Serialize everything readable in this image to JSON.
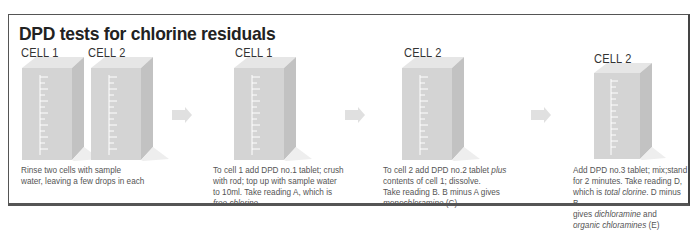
{
  "title": "DPD tests for chlorine residuals",
  "steps": [
    {
      "cells": [
        "CELL 1",
        "CELL 2"
      ],
      "caption_lines": [
        "Rinse two cells with sample",
        "water, leaving a few drops in each"
      ]
    },
    {
      "cells": [
        "CELL 1"
      ],
      "caption_lines": [
        "To cell 1 add DPD no.1 tablet; crush",
        "with rod; top up with sample water",
        "to 10ml. Take reading A, which is"
      ],
      "caption_italic": "free chlorine"
    },
    {
      "cells": [
        "CELL 2"
      ],
      "caption_line1_pre": "To cell 2 add DPD no.2 tablet ",
      "caption_line1_italic": "plus",
      "caption_lines": [
        "contents of cell 1; dissolve.",
        "Take reading B. B minus A gives"
      ],
      "caption_italic": "monochloramine",
      "caption_suffix": " (C)"
    },
    {
      "cells": [
        "CELL 2"
      ],
      "caption_lines": [
        "Add DPD no.3 tablet; mix;stand",
        "for 2 minutes. Take reading D,"
      ],
      "caption_l3_pre": "which is ",
      "caption_l3_italic": "total clorine",
      "caption_l3_post": ". D minus B",
      "caption_l4_pre": "gives ",
      "caption_l4_italic": "dichloramine",
      "caption_l4_post": " and",
      "caption_l5_italic": "organic chloramines",
      "caption_l5_post": " (E)"
    }
  ],
  "icons": [
    "beaker-cell-icon",
    "arrow-right-icon"
  ],
  "colors": {
    "border": "#555555",
    "cell_front": "#d4d4d4",
    "cell_side": "#c2c2c2",
    "cell_top": "#e6e6e6",
    "arrow": "#e0e0e0"
  }
}
